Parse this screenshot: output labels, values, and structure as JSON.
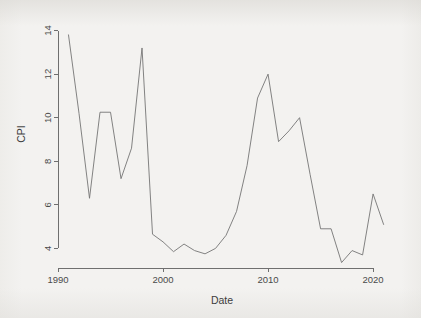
{
  "chart_data": {
    "type": "line",
    "title": "",
    "xlabel": "Date",
    "ylabel": "CPI",
    "xlim": [
      1990.0,
      2021.8
    ],
    "ylim": [
      3.1,
      14.3
    ],
    "xticks": [
      1990,
      2000,
      2010,
      2020
    ],
    "xticklabels": [
      "1990",
      "2000",
      "2010",
      "2020"
    ],
    "yticks": [
      4,
      6,
      8,
      10,
      12,
      14
    ],
    "yticklabels": [
      "4",
      "6",
      "8",
      "10",
      "12",
      "14"
    ],
    "grid": false,
    "legend": false,
    "legend_position": "none",
    "line_color": "#757575",
    "background_color": "#f3f2f0",
    "axis_color": "#6f6f6f",
    "series": [
      {
        "name": "CPI",
        "x": [
          1991,
          1992,
          1993,
          1994,
          1995,
          1996,
          1997,
          1998,
          1999,
          2000,
          2001,
          2002,
          2003,
          2004,
          2005,
          2006,
          2007,
          2008,
          2009,
          2010,
          2011,
          2012,
          2013,
          2014,
          2015,
          2016,
          2017,
          2018,
          2019,
          2020,
          2021
        ],
        "values": [
          13.8,
          10.2,
          6.3,
          10.25,
          10.25,
          7.2,
          8.6,
          13.2,
          4.65,
          4.3,
          3.85,
          4.2,
          3.9,
          3.75,
          4.0,
          4.6,
          5.7,
          7.8,
          10.9,
          12.0,
          8.9,
          9.4,
          10.0,
          7.4,
          4.9,
          4.9,
          3.35,
          3.9,
          3.7,
          6.5,
          5.1
        ]
      }
    ]
  },
  "axes": {
    "y_title": "CPI",
    "x_title": "Date"
  }
}
